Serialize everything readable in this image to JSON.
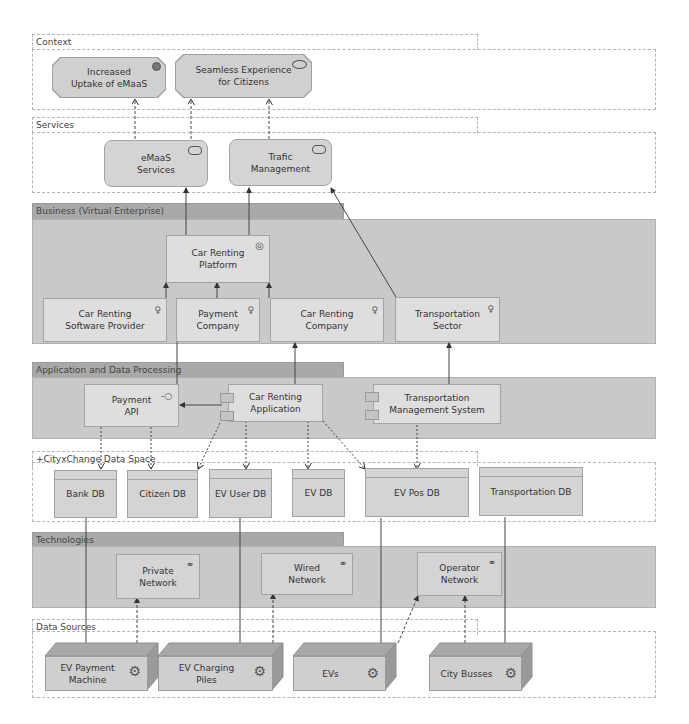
{
  "groups": {
    "context": {
      "label": "Context"
    },
    "services": {
      "label": "Services"
    },
    "business": {
      "label": "Business (Virtual Enterprise)"
    },
    "application": {
      "label": "Application and Data Processing"
    },
    "dataspace": {
      "label": "+CityxChange Data Space"
    },
    "technologies": {
      "label": "Technologies"
    },
    "datasources": {
      "label": "Data Sources"
    }
  },
  "context": {
    "outcome": {
      "label_line1": "Increased",
      "label_line2": "Uptake of eMaaS",
      "icon": "outcome-icon"
    },
    "value": {
      "label_line1": "Seamless Experience",
      "label_line2": "for Citizens",
      "icon": "value-icon"
    }
  },
  "services": {
    "emaas": {
      "label_line1": "eMaaS",
      "label_line2": "Services",
      "icon": "service-icon"
    },
    "traffic": {
      "label_line1": "Trafic",
      "label_line2": "Management",
      "icon": "service-icon"
    }
  },
  "business": {
    "platform": {
      "label_line1": "Car Renting",
      "label_line2": "Platform",
      "icon": "collaboration-icon"
    },
    "actors": [
      {
        "label_line1": "Car Renting",
        "label_line2": "Software Provider",
        "icon": "actor-icon"
      },
      {
        "label_line1": "Payment",
        "label_line2": "Company",
        "icon": "actor-icon"
      },
      {
        "label_line1": "Car Renting",
        "label_line2": "Company",
        "icon": "actor-icon"
      },
      {
        "label_line1": "Transportation",
        "label_line2": "Sector",
        "icon": "actor-icon"
      }
    ]
  },
  "application": {
    "payment_api": {
      "label_line1": "Payment",
      "label_line2": "API",
      "icon": "interface-icon"
    },
    "car_app": {
      "label_line1": "Car Renting",
      "label_line2": "Application",
      "icon": "component-icon"
    },
    "tms": {
      "label_line1": "Transportation",
      "label_line2": "Management System",
      "icon": "component-icon"
    }
  },
  "dataspace": {
    "dbs": [
      "Bank DB",
      "Citizen DB",
      "EV User DB",
      "EV DB",
      "EV Pos DB",
      "Transportation DB"
    ]
  },
  "technologies": {
    "networks": [
      {
        "label_line1": "Private",
        "label_line2": "Network",
        "icon": "network-icon"
      },
      {
        "label_line1": "Wired",
        "label_line2": "Network",
        "icon": "network-icon"
      },
      {
        "label_line1": "Operator",
        "label_line2": "Network",
        "icon": "network-icon"
      }
    ]
  },
  "datasources": {
    "devices": [
      {
        "label_line1": "EV Payment",
        "label_line2": "Machine",
        "icon": "equipment-icon"
      },
      {
        "label_line1": "EV Charging",
        "label_line2": "Piles",
        "icon": "equipment-icon"
      },
      {
        "label_line1": "EVs",
        "label_line2": "",
        "icon": "equipment-icon"
      },
      {
        "label_line1": "City Busses",
        "label_line2": "",
        "icon": "equipment-icon"
      }
    ]
  },
  "colors": {
    "element_fill": "#d4d4d4",
    "layer_fill": "#c9c9c9",
    "layer_tab": "#a9a9a9",
    "line": "#444444",
    "group_border": "#b5b5b5"
  }
}
